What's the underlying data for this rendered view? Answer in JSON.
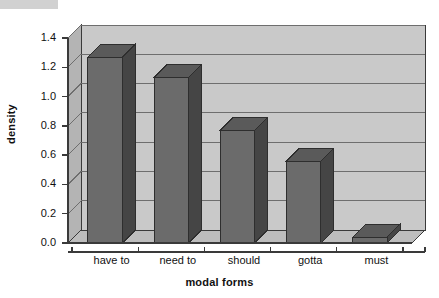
{
  "chart_data": {
    "type": "bar",
    "title": "",
    "subtitle": "",
    "xlabel": "modal forms",
    "ylabel": "density",
    "categories": [
      "have to",
      "need to",
      "should",
      "gotta",
      "must"
    ],
    "values": [
      1.27,
      1.13,
      0.77,
      0.56,
      0.04
    ],
    "series": [
      {
        "name": "density",
        "values": [
          1.27,
          1.13,
          0.77,
          0.56,
          0.04
        ]
      }
    ],
    "ylim": [
      0.0,
      1.4
    ],
    "ytick_labels": [
      "0.0",
      "0.2",
      "0.4",
      "0.6",
      "0.8",
      "1.0",
      "1.2",
      "1.4"
    ],
    "ytick_values": [
      0.0,
      0.2,
      0.4,
      0.6,
      0.8,
      1.0,
      1.2,
      1.4
    ],
    "grid": "horizontal",
    "legend": "none",
    "style": "3d-column",
    "colors": {
      "bar_front": "#6b6b6b",
      "bar_side": "#454545",
      "bar_top": "#5a5a5a",
      "wall_back": "#c9c9c9",
      "wall_side": "#b4b4b4",
      "floor": "#bdbdbd",
      "gridline": "#6e6e6e",
      "axis": "#3a3a3a",
      "text": "#111111",
      "background": "#ffffff"
    }
  },
  "axis": {
    "y_title": "density",
    "x_title": "modal forms"
  },
  "ticks": {
    "y": [
      {
        "label": "1.4"
      },
      {
        "label": "1.2"
      },
      {
        "label": "1.0"
      },
      {
        "label": "0.8"
      },
      {
        "label": "0.6"
      },
      {
        "label": "0.4"
      },
      {
        "label": "0.2"
      },
      {
        "label": "0.0"
      }
    ],
    "x": [
      {
        "label": "have to"
      },
      {
        "label": "need to"
      },
      {
        "label": "should"
      },
      {
        "label": "gotta"
      },
      {
        "label": "must"
      }
    ]
  }
}
